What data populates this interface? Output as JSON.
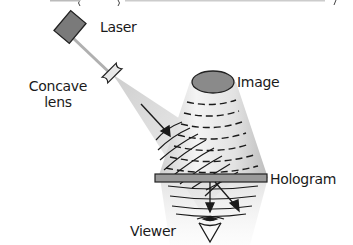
{
  "diagram": {
    "type": "hologram-viewing-schematic",
    "labels": {
      "laser": "Laser",
      "concave_lens_line1": "Concave",
      "concave_lens_line2": "lens",
      "image": "Image",
      "hologram": "Hologram",
      "viewer": "Viewer"
    },
    "colors": {
      "laser_body": "#7a7a7a",
      "laser_outline": "#222222",
      "beam": "#b5b5b5",
      "image_disk": "#8a8a8a",
      "hologram_plate": "#9a9a9a",
      "wave_lines": "#1a1a1a",
      "cone_light": "#d8d8d8",
      "text": "#1a1a1a"
    }
  }
}
